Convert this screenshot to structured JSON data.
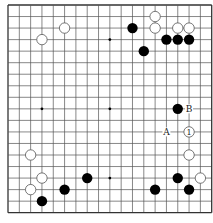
{
  "diagram": {
    "type": "go-board",
    "size": 19,
    "colors": {
      "background": "#ffffff",
      "line": "#555555",
      "edge": "#333333",
      "black_stone": "#000000",
      "white_stone_fill": "#ffffff",
      "white_stone_stroke": "#555555",
      "label": "#222222"
    },
    "star_points": [
      [
        3,
        3
      ],
      [
        9,
        3
      ],
      [
        15,
        3
      ],
      [
        3,
        9
      ],
      [
        9,
        9
      ],
      [
        15,
        9
      ],
      [
        3,
        15
      ],
      [
        9,
        15
      ],
      [
        15,
        15
      ]
    ],
    "stones": [
      {
        "color": "white",
        "col": 5,
        "row": 2
      },
      {
        "color": "white",
        "col": 3,
        "row": 3
      },
      {
        "color": "white",
        "col": 13,
        "row": 1
      },
      {
        "color": "white",
        "col": 13,
        "row": 2
      },
      {
        "color": "black",
        "col": 11,
        "row": 2
      },
      {
        "color": "white",
        "col": 15,
        "row": 2
      },
      {
        "color": "white",
        "col": 16,
        "row": 2
      },
      {
        "color": "black",
        "col": 14,
        "row": 3
      },
      {
        "color": "black",
        "col": 15,
        "row": 3
      },
      {
        "color": "black",
        "col": 16,
        "row": 3
      },
      {
        "color": "black",
        "col": 12,
        "row": 4
      },
      {
        "color": "black",
        "col": 15,
        "row": 9
      },
      {
        "color": "white",
        "col": 16,
        "row": 11,
        "label": "1"
      },
      {
        "color": "white",
        "col": 16,
        "row": 13
      },
      {
        "color": "black",
        "col": 15,
        "row": 15
      },
      {
        "color": "white",
        "col": 17,
        "row": 15
      },
      {
        "color": "black",
        "col": 13,
        "row": 16
      },
      {
        "color": "black",
        "col": 16,
        "row": 16
      },
      {
        "color": "white",
        "col": 2,
        "row": 13
      },
      {
        "color": "white",
        "col": 3,
        "row": 15
      },
      {
        "color": "white",
        "col": 2,
        "row": 16
      },
      {
        "color": "black",
        "col": 3,
        "row": 17
      },
      {
        "color": "black",
        "col": 5,
        "row": 16
      },
      {
        "color": "black",
        "col": 7,
        "row": 15
      }
    ],
    "labels": [
      {
        "text": "B",
        "col": 16,
        "row": 9
      },
      {
        "text": "A",
        "col": 14,
        "row": 11
      }
    ]
  }
}
